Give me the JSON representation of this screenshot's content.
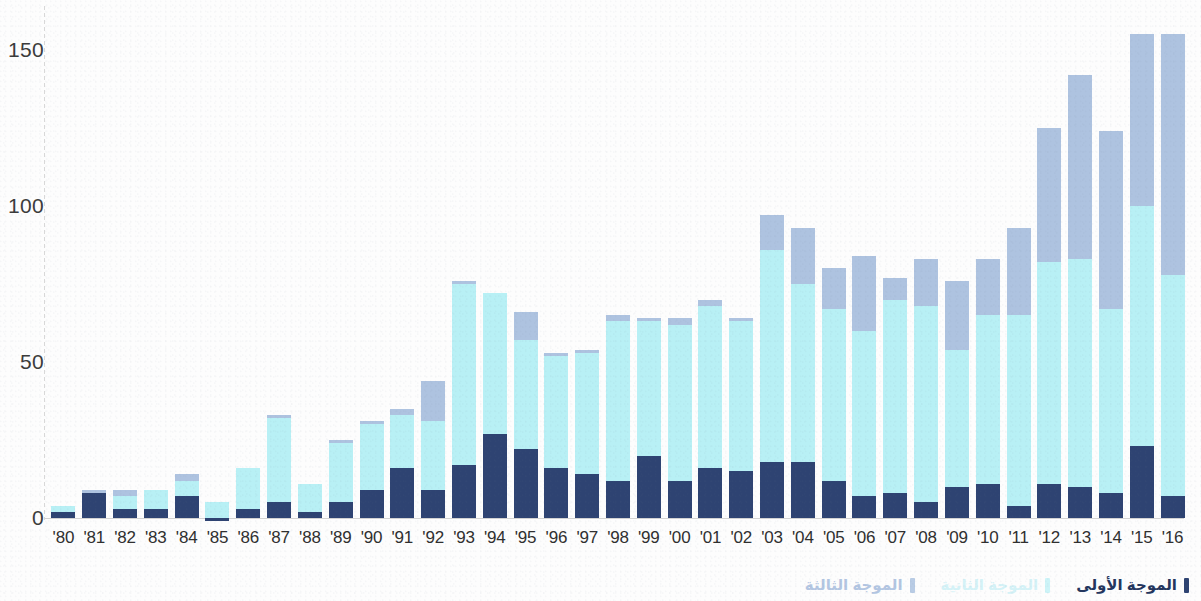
{
  "chart_data": {
    "type": "bar",
    "stacked": true,
    "title": "",
    "subtitle": "",
    "xlabel": "",
    "ylabel": "",
    "ylim": [
      0,
      155
    ],
    "y_ticks": [
      0,
      50,
      100,
      150
    ],
    "grid": false,
    "legend_position": "bottom-right",
    "text_direction": "rtl",
    "categories": [
      "'80",
      "'81",
      "'82",
      "'83",
      "'84",
      "'85",
      "'86",
      "'87",
      "'88",
      "'89",
      "'90",
      "'91",
      "'92",
      "'93",
      "'94",
      "'95",
      "'96",
      "'97",
      "'98",
      "'99",
      "'00",
      "'01",
      "'02",
      "'03",
      "'04",
      "'05",
      "'06",
      "'07",
      "'08",
      "'09",
      "'10",
      "'11",
      "'12",
      "'13",
      "'14",
      "'15",
      "'16"
    ],
    "series": [
      {
        "name": "الموجة الأولى",
        "color": "#2e4372",
        "values": [
          2,
          8,
          3,
          3,
          7,
          -1,
          3,
          5,
          2,
          5,
          9,
          16,
          9,
          17,
          27,
          22,
          16,
          14,
          12,
          20,
          12,
          16,
          15,
          18,
          18,
          12,
          7,
          8,
          5,
          10,
          11,
          4,
          11,
          10,
          8,
          23,
          7
        ]
      },
      {
        "name": "الموجة الثانية",
        "color": "#b8f0f5",
        "values": [
          2,
          0,
          4,
          6,
          5,
          5,
          13,
          27,
          9,
          19,
          21,
          17,
          22,
          58,
          45,
          35,
          36,
          39,
          51,
          43,
          50,
          52,
          48,
          68,
          57,
          55,
          53,
          62,
          63,
          44,
          54,
          61,
          71,
          73,
          59,
          77,
          71
        ]
      },
      {
        "name": "الموجة الثالثة",
        "color": "#aec3e0",
        "values": [
          0,
          1,
          2,
          0,
          2,
          0,
          0,
          1,
          0,
          1,
          1,
          2,
          13,
          1,
          0,
          9,
          1,
          1,
          2,
          1,
          2,
          2,
          1,
          11,
          18,
          13,
          24,
          7,
          15,
          22,
          18,
          28,
          43,
          59,
          57,
          55,
          77
        ]
      }
    ]
  },
  "axes": {
    "y_tick_labels": [
      "150",
      "100",
      "50",
      "0"
    ],
    "x_tick_labels": [
      "'80",
      "'81",
      "'82",
      "'83",
      "'84",
      "'85",
      "'86",
      "'87",
      "'88",
      "'89",
      "'90",
      "'91",
      "'92",
      "'93",
      "'94",
      "'95",
      "'96",
      "'97",
      "'98",
      "'99",
      "'00",
      "'01",
      "'02",
      "'03",
      "'04",
      "'05",
      "'06",
      "'07",
      "'08",
      "'09",
      "'10",
      "'11",
      "'12",
      "'13",
      "'14",
      "'15",
      "'16"
    ]
  },
  "legend": {
    "items": [
      {
        "label": "الموجة الأولى",
        "swatch_color": "#2e4372",
        "key": "w1"
      },
      {
        "label": "الموجة الثانية",
        "swatch_color": "#cdf4f8",
        "key": "w2"
      },
      {
        "label": "الموجة الثالثة",
        "swatch_color": "#b9cce5",
        "key": "w3"
      }
    ]
  },
  "colors": {
    "wave_one": "#2e4372",
    "wave_two": "#b8f0f5",
    "wave_three": "#aec3e0",
    "background": "#fdfdfd",
    "axis_text": "#2f2f2f"
  }
}
